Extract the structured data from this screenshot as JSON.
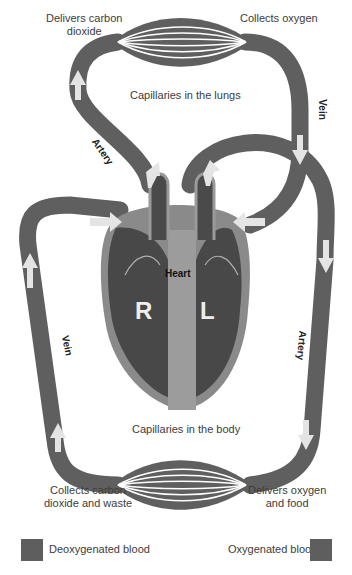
{
  "colors": {
    "vessel": "#5f5f5f",
    "heart_chamber": "#4a4a4a",
    "heart_wall": "#9a9a9a",
    "arrow": "#d8d8d8",
    "background": "#ffffff"
  },
  "labels": {
    "delivers_co2": "Delivers carbon\ndioxide",
    "collects_oxygen": "Collects oxygen",
    "capillaries_lungs": "Capillaries in the lungs",
    "capillaries_body": "Capillaries in the body",
    "collects_co2": "Collects carbon\ndioxide and waste",
    "delivers_oxygen": "Delivers oxygen\nand food",
    "heart": "Heart",
    "right": "R",
    "left": "L"
  },
  "vessel_labels": {
    "artery_upper": "Artery",
    "vein_upper": "Vein",
    "vein_lower": "Vein",
    "artery_lower": "Artery"
  },
  "legend": [
    {
      "label": "Deoxygenated blood",
      "color": "#5e5e5e"
    },
    {
      "label": "Oxygenated blood",
      "color": "#5e5e5e"
    }
  ]
}
